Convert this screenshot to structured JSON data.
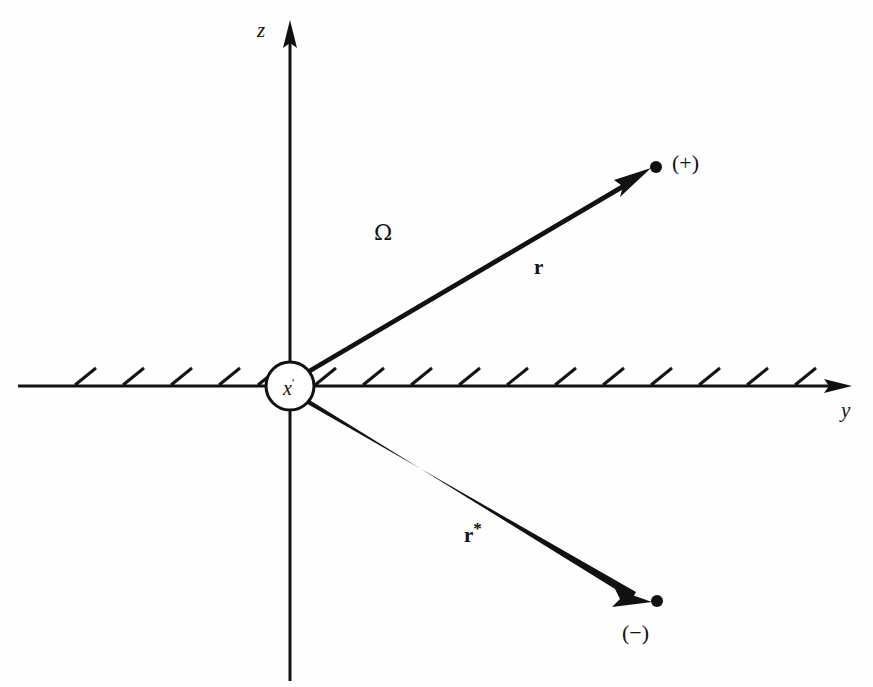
{
  "figure": {
    "background_color": "#fefefe",
    "ink_color": "#111111",
    "axes": {
      "vertical": {
        "name": "z",
        "label": "z",
        "x": 290,
        "top_y": 22,
        "bottom_y": 681,
        "arrow_at": "top"
      },
      "horizontal": {
        "name": "y",
        "label": "y",
        "y": 386,
        "left_x": 18,
        "right_x": 852,
        "arrow_at": "right"
      }
    },
    "origin": {
      "label": "x",
      "prime": "'",
      "cx": 290,
      "cy": 386,
      "r": 24
    },
    "boundary": {
      "description": "hatched half-space interface along the y axis",
      "hatch_count": 19,
      "hatch_spacing": 48,
      "hatch_length": 26,
      "hatch_first_x": 75,
      "hatch_angle_deg": 35
    },
    "solid_angle": {
      "label": "Ω",
      "x": 374,
      "y": 222
    },
    "vectors": [
      {
        "name": "r",
        "label": "r",
        "star": "",
        "from_x": 305,
        "from_y": 373,
        "to_x": 648,
        "to_y": 172,
        "endpoint_x": 656,
        "endpoint_y": 167,
        "endpoint_label": "(+)",
        "endpoint_label_x": 672,
        "endpoint_label_y": 152,
        "label_x": 534,
        "label_y": 252,
        "base_width": 7,
        "tip_width": 3
      },
      {
        "name": "r-star",
        "label": "r",
        "star": "*",
        "from_x": 305,
        "from_y": 400,
        "to_x": 648,
        "to_y": 596,
        "endpoint_x": 657,
        "endpoint_y": 601,
        "endpoint_label": "(−)",
        "endpoint_label_x": 622,
        "endpoint_label_y": 622,
        "label_x": 464,
        "label_y": 520,
        "base_width": 7,
        "tip_width": 3
      }
    ]
  }
}
